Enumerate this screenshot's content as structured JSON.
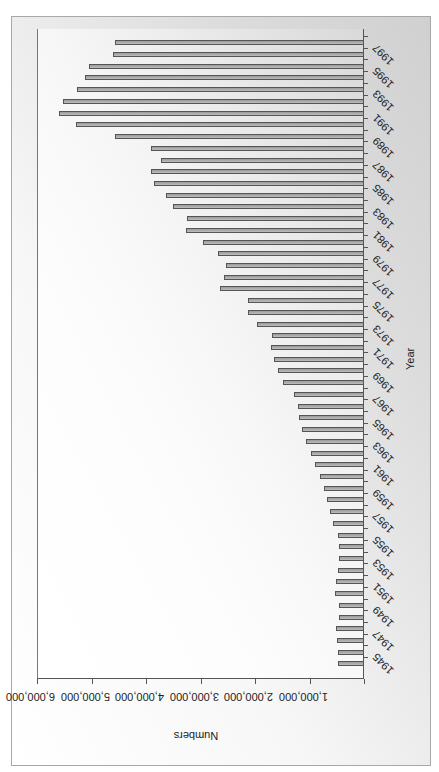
{
  "chart_data": {
    "type": "bar",
    "orientation": "column chart rotated 90deg counter-clockwise",
    "title": "",
    "xlabel": "Year",
    "ylabel": "Numbers",
    "ylim": [
      0,
      6000000
    ],
    "yticks": [
      "1,000,000",
      "2,000,000",
      "3,000,000",
      "4,000,000",
      "5,000,000",
      "6,000,000"
    ],
    "xtick_labels": [
      "1945",
      "1947",
      "1949",
      "1951",
      "1953",
      "1955",
      "1957",
      "1959",
      "1961",
      "1963",
      "1965",
      "1967",
      "1969",
      "1971",
      "1973",
      "1975",
      "1977",
      "1979",
      "1981",
      "1983",
      "1985",
      "1987",
      "1989",
      "1991",
      "1993",
      "1995",
      "1997"
    ],
    "grid": false,
    "legend": null,
    "categories": [
      "1945",
      "1946",
      "1947",
      "1948",
      "1949",
      "1950",
      "1951",
      "1952",
      "1953",
      "1954",
      "1955",
      "1956",
      "1957",
      "1958",
      "1959",
      "1960",
      "1961",
      "1962",
      "1963",
      "1964",
      "1965",
      "1966",
      "1967",
      "1968",
      "1969",
      "1970",
      "1971",
      "1972",
      "1973",
      "1974",
      "1975",
      "1976",
      "1977",
      "1978",
      "1979",
      "1980",
      "1981",
      "1982",
      "1983",
      "1984",
      "1985",
      "1986",
      "1987",
      "1988",
      "1989",
      "1990",
      "1991",
      "1992",
      "1993",
      "1994",
      "1995",
      "1996",
      "1997",
      "1998"
    ],
    "values": [
      480000,
      480000,
      500000,
      520000,
      460000,
      460000,
      540000,
      520000,
      480000,
      450000,
      450000,
      480000,
      560000,
      630000,
      680000,
      740000,
      810000,
      890000,
      980000,
      1070000,
      1140000,
      1200000,
      1220000,
      1290000,
      1490000,
      1570000,
      1660000,
      1700000,
      1680000,
      1970000,
      2120000,
      2130000,
      2650000,
      2560000,
      2540000,
      2680000,
      2960000,
      3270000,
      3250000,
      3510000,
      3640000,
      3860000,
      3900000,
      3730000,
      3900000,
      4570000,
      5290000,
      5600000,
      5530000,
      5270000,
      5120000,
      5050000,
      4610000,
      4570000
    ]
  }
}
